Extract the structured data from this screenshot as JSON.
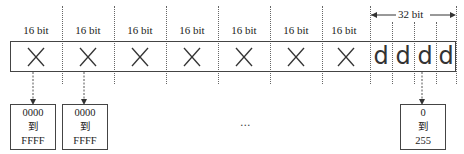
{
  "diagram": {
    "cells": [
      {
        "label": "16 bit",
        "content": "×"
      },
      {
        "label": "16 bit",
        "content": "×"
      },
      {
        "label": "16 bit",
        "content": "×"
      },
      {
        "label": "16 bit",
        "content": "×"
      },
      {
        "label": "16 bit",
        "content": "×"
      },
      {
        "label": "16 bit",
        "content": "×"
      },
      {
        "label": "16 bit",
        "content": "×"
      }
    ],
    "d_cells": [
      "d",
      "d",
      "d",
      "d"
    ],
    "span_label": "32 bit",
    "ranges": [
      {
        "from": "0000",
        "to_word": "到",
        "to": "FFFF"
      },
      {
        "from": "0000",
        "to_word": "到",
        "to": "FFFF"
      },
      {
        "from": "0",
        "to_word": "到",
        "to": "255"
      }
    ],
    "ellipsis": "..."
  }
}
